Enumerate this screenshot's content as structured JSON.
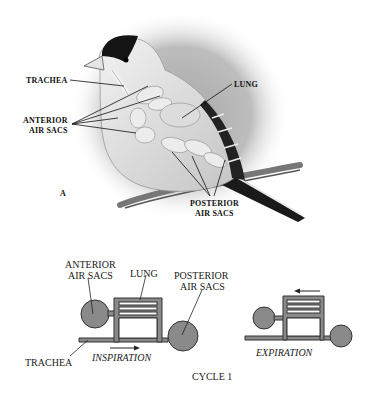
{
  "figure": {
    "panel_a": {
      "panel_letter": "A",
      "labels": {
        "trachea": "TRACHEA",
        "lung": "LUNG",
        "anterior_line1": "ANTERIOR",
        "anterior_line2": "AIR SACS",
        "posterior_line1": "POSTERIOR",
        "posterior_line2": "AIR SACS"
      }
    },
    "schematic": {
      "inspiration": {
        "anterior_line1": "ANTERIOR",
        "anterior_line2": "AIR SACS",
        "lung": "LUNG",
        "posterior_line1": "POSTERIOR",
        "posterior_line2": "AIR SACS",
        "trachea": "TRACHEA",
        "phase": "INSPIRATION",
        "arrow_direction": "right"
      },
      "expiration": {
        "phase": "EXPIRATION",
        "arrow_direction": "left"
      },
      "caption": "CYCLE 1"
    },
    "colors": {
      "ink": "#111111",
      "sac_fill": "#8a8a8a",
      "bird_cap": "#141414",
      "bird_body": "#d6d6d6",
      "background_vignette": "#9a9a9a"
    }
  }
}
